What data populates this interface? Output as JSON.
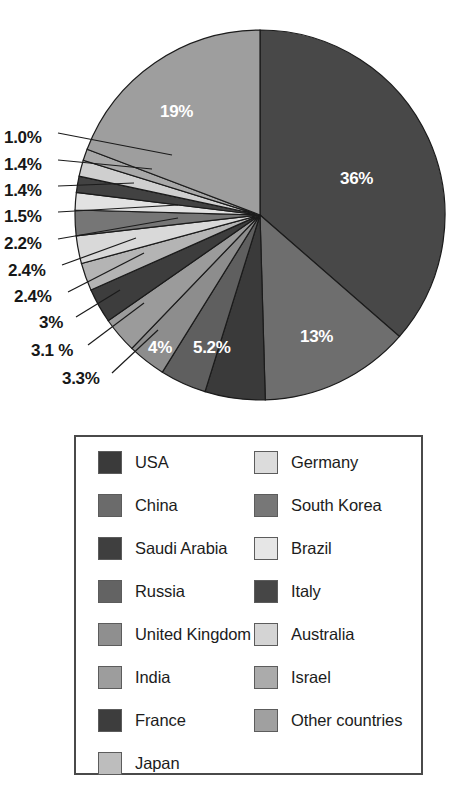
{
  "chart_data": {
    "type": "pie",
    "title": "",
    "subtitle": "",
    "xlabel": "",
    "ylabel": "",
    "legend_position": "bottom",
    "grid": false,
    "start_angle_deg": 0,
    "direction": "clockwise",
    "categories": [
      "USA",
      "China",
      "Saudi Arabia",
      "Russia",
      "United Kingdom",
      "India",
      "France",
      "Japan",
      "Germany",
      "South Korea",
      "Brazil",
      "Italy",
      "Australia",
      "Israel",
      "Other countries"
    ],
    "values": [
      36,
      13,
      5.2,
      4,
      3.3,
      3.1,
      3,
      2.4,
      2.4,
      2.2,
      1.5,
      1.4,
      1.4,
      1.0,
      19
    ],
    "labels": [
      "36%",
      "13%",
      "5.2%",
      "4%",
      "3.3%",
      "3.1 %",
      "3%",
      "2.4%",
      "2.4%",
      "2.2%",
      "1.5%",
      "1.4%",
      "1.4%",
      "1.0%",
      "19%"
    ],
    "colors": [
      "#484848",
      "#6e6e6e",
      "#3a3a3a",
      "#5f5f5f",
      "#8d8d8d",
      "#9b9b9b",
      "#3d3d3d",
      "#b4b4b4",
      "#d9d9d9",
      "#767676",
      "#e2e2e2",
      "#424242",
      "#cfcfcf",
      "#a8a8a8",
      "#9e9e9e"
    ],
    "slices": [
      {
        "name": "USA",
        "value": 36,
        "label": "36%",
        "color": "#484848",
        "label_placement": "inside"
      },
      {
        "name": "China",
        "value": 13,
        "label": "13%",
        "color": "#6e6e6e",
        "label_placement": "inside"
      },
      {
        "name": "Saudi Arabia",
        "value": 5.2,
        "label": "5.2%",
        "color": "#3a3a3a",
        "label_placement": "inside"
      },
      {
        "name": "Russia",
        "value": 4,
        "label": "4%",
        "color": "#5f5f5f",
        "label_placement": "inside"
      },
      {
        "name": "United Kingdom",
        "value": 3.3,
        "label": "3.3%",
        "color": "#8d8d8d",
        "label_placement": "outside"
      },
      {
        "name": "India",
        "value": 3.1,
        "label": "3.1 %",
        "color": "#9b9b9b",
        "label_placement": "outside"
      },
      {
        "name": "France",
        "value": 3,
        "label": "3%",
        "color": "#3d3d3d",
        "label_placement": "outside"
      },
      {
        "name": "Japan",
        "value": 2.4,
        "label": "2.4%",
        "color": "#b4b4b4",
        "label_placement": "outside"
      },
      {
        "name": "Germany",
        "value": 2.4,
        "label": "2.4%",
        "color": "#d9d9d9",
        "label_placement": "outside"
      },
      {
        "name": "South Korea",
        "value": 2.2,
        "label": "2.2%",
        "color": "#767676",
        "label_placement": "outside"
      },
      {
        "name": "Brazil",
        "value": 1.5,
        "label": "1.5%",
        "color": "#e2e2e2",
        "label_placement": "outside"
      },
      {
        "name": "Italy",
        "value": 1.4,
        "label": "1.4%",
        "color": "#424242",
        "label_placement": "outside"
      },
      {
        "name": "Australia",
        "value": 1.4,
        "label": "1.4%",
        "color": "#cfcfcf",
        "label_placement": "outside"
      },
      {
        "name": "Israel",
        "value": 1.0,
        "label": "1.0%",
        "color": "#a8a8a8",
        "label_placement": "outside"
      },
      {
        "name": "Other countries",
        "value": 19,
        "label": "19%",
        "color": "#9e9e9e",
        "label_placement": "inside"
      }
    ]
  },
  "pie_geometry": {
    "cx": 260,
    "cy": 215,
    "r": 185,
    "stroke": "#1b1b1b",
    "stroke_width": 1.2
  },
  "value_labels": [
    {
      "text": "36%",
      "x": 340,
      "y": 170,
      "placement": "inside"
    },
    {
      "text": "13%",
      "x": 300,
      "y": 328,
      "placement": "inside"
    },
    {
      "text": "5.2%",
      "x": 193,
      "y": 339,
      "placement": "inside"
    },
    {
      "text": "4%",
      "x": 148,
      "y": 339,
      "placement": "inside"
    },
    {
      "text": "19%",
      "x": 160,
      "y": 103,
      "placement": "inside"
    },
    {
      "text": "1.0%",
      "x": 4,
      "y": 129,
      "placement": "outside"
    },
    {
      "text": "1.4%",
      "x": 4,
      "y": 156,
      "placement": "outside"
    },
    {
      "text": "1.4%",
      "x": 4,
      "y": 182,
      "placement": "outside"
    },
    {
      "text": "1.5%",
      "x": 4,
      "y": 208,
      "placement": "outside"
    },
    {
      "text": "2.2%",
      "x": 4,
      "y": 235,
      "placement": "outside"
    },
    {
      "text": "2.4%",
      "x": 8,
      "y": 262,
      "placement": "outside"
    },
    {
      "text": "2.4%",
      "x": 14,
      "y": 288,
      "placement": "outside"
    },
    {
      "text": "3%",
      "x": 39,
      "y": 314,
      "placement": "outside"
    },
    {
      "text": "3.1 %",
      "x": 31,
      "y": 342,
      "placement": "outside"
    },
    {
      "text": "3.3%",
      "x": 62,
      "y": 370,
      "placement": "outside"
    }
  ],
  "leader_lines": [
    {
      "x1": 58,
      "y1": 133,
      "x2": 172,
      "y2": 155
    },
    {
      "x1": 58,
      "y1": 160,
      "x2": 152,
      "y2": 169
    },
    {
      "x1": 58,
      "y1": 186,
      "x2": 134,
      "y2": 183
    },
    {
      "x1": 58,
      "y1": 212,
      "x2": 178,
      "y2": 205
    },
    {
      "x1": 58,
      "y1": 239,
      "x2": 178,
      "y2": 218
    },
    {
      "x1": 62,
      "y1": 265,
      "x2": 136,
      "y2": 238
    },
    {
      "x1": 68,
      "y1": 292,
      "x2": 144,
      "y2": 253
    },
    {
      "x1": 76,
      "y1": 317,
      "x2": 120,
      "y2": 290
    },
    {
      "x1": 88,
      "y1": 345,
      "x2": 144,
      "y2": 303
    },
    {
      "x1": 112,
      "y1": 373,
      "x2": 158,
      "y2": 330
    }
  ],
  "legend": {
    "columns": [
      {
        "name": "legend-column-left",
        "items": [
          {
            "label": "USA",
            "color": "#3a3a3a"
          },
          {
            "label": "China",
            "color": "#6b6b6b"
          },
          {
            "label": "Saudi Arabia",
            "color": "#3f3f3f"
          },
          {
            "label": "Russia",
            "color": "#636363"
          },
          {
            "label": "United Kingdom",
            "color": "#8f8f8f"
          },
          {
            "label": "India",
            "color": "#9d9d9d"
          },
          {
            "label": "France",
            "color": "#3d3d3d"
          },
          {
            "label": "Japan",
            "color": "#bdbdbd"
          }
        ]
      },
      {
        "name": "legend-column-right",
        "items": [
          {
            "label": "Germany",
            "color": "#dcdcdc"
          },
          {
            "label": "South Korea",
            "color": "#777777"
          },
          {
            "label": "Brazil",
            "color": "#e6e6e6"
          },
          {
            "label": "Italy",
            "color": "#464646"
          },
          {
            "label": "Australia",
            "color": "#d4d4d4"
          },
          {
            "label": "Israel",
            "color": "#ababab"
          },
          {
            "label": "Other countries",
            "color": "#a0a0a0"
          }
        ]
      }
    ]
  }
}
